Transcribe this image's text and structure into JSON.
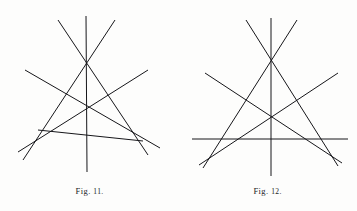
{
  "page": {
    "background_color": "#fdfdfc",
    "ink_color": "#16161a",
    "width": 357,
    "height": 211
  },
  "figures": [
    {
      "id": "figure-11",
      "caption_word": "Fig.",
      "caption_number": "11.",
      "caption_full": "Fig. 11.",
      "description": "Six straight lines of a scalene triangle with three cevians meeting at an interior point",
      "stroke_width": 1.0,
      "key_points": {
        "apex": [
          86,
          48
        ],
        "centroid": [
          86,
          105
        ],
        "left_cross": [
          43,
          138
        ],
        "right_cross": [
          130,
          132
        ]
      },
      "lines": [
        {
          "name": "cevian-vertical",
          "x1": 86,
          "y1": 16,
          "x2": 87,
          "y2": 172
        },
        {
          "name": "side-left-long",
          "x1": 58,
          "y1": 20,
          "x2": 148,
          "y2": 155
        },
        {
          "name": "side-right-long",
          "x1": 115,
          "y1": 20,
          "x2": 23,
          "y2": 160
        },
        {
          "name": "transversal-left-to-right",
          "x1": 25,
          "y1": 70,
          "x2": 160,
          "y2": 148
        },
        {
          "name": "transversal-right-to-left",
          "x1": 148,
          "y1": 70,
          "x2": 18,
          "y2": 152
        },
        {
          "name": "base-oblique",
          "x1": 38,
          "y1": 130,
          "x2": 143,
          "y2": 141
        }
      ]
    },
    {
      "id": "figure-12",
      "caption_word": "Fig.",
      "caption_number": "12.",
      "caption_full": "Fig. 12.",
      "description": "Symmetric triangle with horizontal base line and three concurrent cevians through an interior point",
      "stroke_width": 1.0,
      "key_points": {
        "apex": [
          271,
          55
        ],
        "centroid": [
          270,
          110
        ],
        "base_left_vertex": [
          222,
          139
        ],
        "base_right_vertex": [
          319,
          139
        ]
      },
      "lines": [
        {
          "name": "base-horizontal",
          "x1": 192,
          "y1": 139,
          "x2": 348,
          "y2": 139
        },
        {
          "name": "cevian-vertical",
          "x1": 271,
          "y1": 18,
          "x2": 271,
          "y2": 176
        },
        {
          "name": "side-left",
          "x1": 246,
          "y1": 20,
          "x2": 338,
          "y2": 166
        },
        {
          "name": "side-right",
          "x1": 297,
          "y1": 20,
          "x2": 203,
          "y2": 168
        },
        {
          "name": "median-left-to-right",
          "x1": 205,
          "y1": 73,
          "x2": 342,
          "y2": 163
        },
        {
          "name": "median-right-to-left",
          "x1": 338,
          "y1": 73,
          "x2": 199,
          "y2": 165
        }
      ]
    }
  ]
}
